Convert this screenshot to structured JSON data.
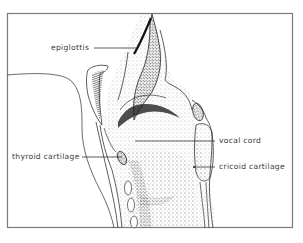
{
  "figure": {
    "background": "#ffffff",
    "frame_color": "#7a7a7a",
    "ink_color": "#222222"
  },
  "labels": [
    {
      "id": "epiglottis",
      "text": "epiglottis"
    },
    {
      "id": "thyroid_cartilage",
      "text": "thyroid cartilage"
    },
    {
      "id": "vocal_cord",
      "text": "vocal cord"
    },
    {
      "id": "cricoid_cartilage",
      "text": "cricoid cartilage"
    }
  ]
}
